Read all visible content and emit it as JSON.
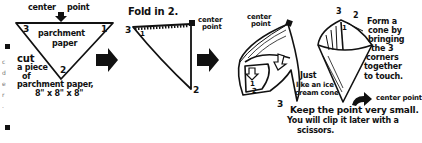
{
  "diagram": {
    "colors": {
      "ink": "#111111",
      "background": "#ffffff",
      "margin_text": "#777777"
    },
    "left_margin": {
      "chars": [
        "c",
        "d",
        "e",
        "r",
        "."
      ]
    },
    "step1": {
      "top_label": "center",
      "top_label_2": "point",
      "shape_label_line1": "parchment",
      "shape_label_line2": "paper",
      "corner_3": "3",
      "corner_1": "1",
      "corner_2": "2",
      "instruction_line1": "cut",
      "instruction_line2": "a piece",
      "instruction_line3": "of",
      "instruction_line4": "parchment paper,",
      "instruction_line5": "8\" x 8\" x 8\""
    },
    "step2": {
      "title": "Fold in 2.",
      "center_label_line1": "center",
      "center_label_line2": "point",
      "corner_3": "3",
      "corner_1": "1",
      "corner_2": "2"
    },
    "step3": {
      "center_label_line1": "center",
      "center_label_line2": "point",
      "corner_1": "1",
      "corner_2": "2",
      "corner_3": "3",
      "side_note_line1": "Just",
      "side_note_line2": "like an ice",
      "side_note_line3": "cream cone"
    },
    "step4": {
      "corner_3": "3",
      "corner_2": "2",
      "corner_1": "1",
      "instruction_line1": "Form a",
      "instruction_line2": "cone by",
      "instruction_line3": "bringing",
      "instruction_line4": "the 3",
      "instruction_line5": "corners",
      "instruction_line6": "together",
      "instruction_line7": "to touch.",
      "center_point_label": "center point",
      "bottom_line1": "Keep the point very small.",
      "bottom_line2": "You will clip it later with a",
      "bottom_line3": "scissors."
    },
    "arrows": [
      "arrow-right",
      "arrow-right"
    ]
  }
}
